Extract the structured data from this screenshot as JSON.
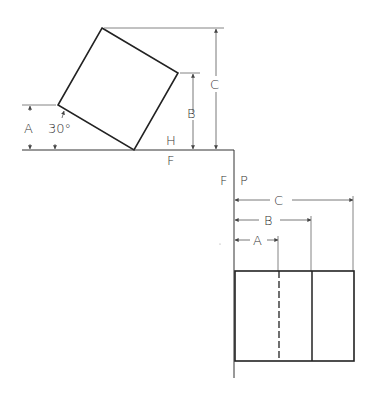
{
  "diagram": {
    "colors": {
      "line": "#222222",
      "thin": "#555555",
      "background": "#ffffff"
    },
    "top_view": {
      "angle_label": "30°",
      "dimension_labels": {
        "a": "A",
        "b": "B",
        "c": "C"
      },
      "fold_labels": {
        "upper": "H",
        "lower": "F"
      }
    },
    "profile_view": {
      "fold_labels": {
        "left": "F",
        "right": "P"
      },
      "dimension_labels": {
        "a": "A",
        "b": "B",
        "c": "C"
      }
    }
  }
}
